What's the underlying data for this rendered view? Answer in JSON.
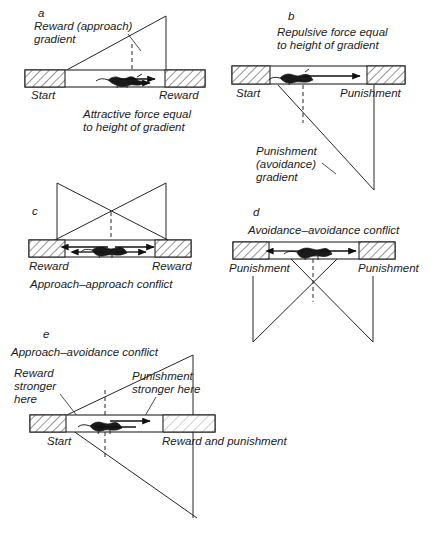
{
  "figure": {
    "background_color": "#ffffff",
    "ink_color": "#262626"
  },
  "panels": [
    {
      "id": "a",
      "letter": "a",
      "labels": {
        "gradient_line1": "Reward (approach)",
        "gradient_line2": "gradient",
        "left_zone": "Start",
        "right_zone": "Reward",
        "caption_line1": "Attractive force equal",
        "caption_line2": "to height of gradient"
      }
    },
    {
      "id": "b",
      "letter": "b",
      "labels": {
        "caption_line1": "Repulsive force equal",
        "caption_line2": "to height of gradient",
        "left_zone": "Start",
        "right_zone": "Punishment",
        "gradient_line1": "Punishment",
        "gradient_line2": "(avoidance)",
        "gradient_line3": "gradient"
      }
    },
    {
      "id": "c",
      "letter": "c",
      "labels": {
        "left_zone": "Reward",
        "right_zone": "Reward",
        "caption": "Approach–approach conflict"
      }
    },
    {
      "id": "d",
      "letter": "d",
      "labels": {
        "caption": "Avoidance–avoidance conflict",
        "left_zone": "Punishment",
        "right_zone": "Punishment"
      }
    },
    {
      "id": "e",
      "letter": "e",
      "labels": {
        "caption": "Approach–avoidance conflict",
        "reward_note_line1": "Reward",
        "reward_note_line2": "stronger",
        "reward_note_line3": "here",
        "punishment_note_line1": "Punishment",
        "punishment_note_line2": "stronger here",
        "left_zone": "Start",
        "right_zone": "Reward and punishment"
      }
    }
  ]
}
